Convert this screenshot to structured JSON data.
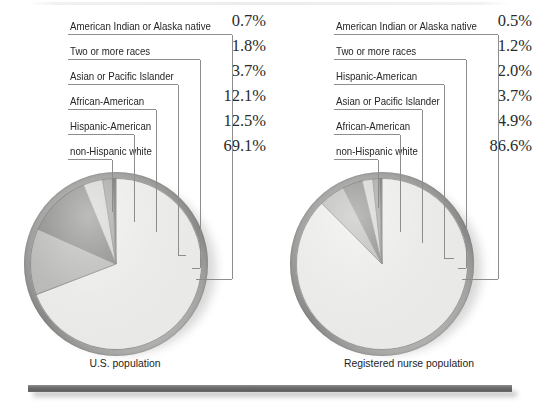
{
  "chart_data": [
    {
      "type": "pie",
      "title": "U.S. population",
      "caption": "U.S. population",
      "categories": [
        "non-Hispanic white",
        "Hispanic-American",
        "African-American",
        "Asian or Pacific Islander",
        "Two or more races",
        "American Indian or Alaska native"
      ],
      "values": [
        69.1,
        12.5,
        12.1,
        3.7,
        1.8,
        0.7
      ],
      "value_labels": [
        "69.1%",
        "12.5%",
        "12.1%",
        "3.7%",
        "1.8%",
        "0.7%"
      ],
      "unit": "percent",
      "legend_position": "above",
      "grid": false,
      "start_angle_deg": 0,
      "direction": "clockwise",
      "slice_colors": [
        "#e9e9e7",
        "#b4b4b2",
        "#7f7f7d",
        "#cfcfcd",
        "#9a9a98",
        "#5e5e5c"
      ]
    },
    {
      "type": "pie",
      "title": "Registered nurse population",
      "caption": "Registered nurse population",
      "categories": [
        "non-Hispanic white",
        "African-American",
        "Asian or Pacific Islander",
        "Hispanic-American",
        "Two or more races",
        "American Indian or Alaska native"
      ],
      "values": [
        86.6,
        4.9,
        3.7,
        2.0,
        1.2,
        0.5
      ],
      "value_labels": [
        "86.6%",
        "4.9%",
        "3.7%",
        "2.0%",
        "1.2%",
        "0.5%"
      ],
      "unit": "percent",
      "legend_position": "above",
      "grid": false,
      "start_angle_deg": 0,
      "direction": "clockwise",
      "slice_colors": [
        "#e9e9e7",
        "#b4b4b2",
        "#7f7f7d",
        "#cfcfcd",
        "#9a9a98",
        "#5e5e5c"
      ]
    }
  ],
  "left_chart": {
    "caption": "U.S. population",
    "legend": [
      {
        "pct": "0.7%",
        "label": "American Indian or Alaska native"
      },
      {
        "pct": "1.8%",
        "label": "Two or more races"
      },
      {
        "pct": "3.7%",
        "label": "Asian or Pacific Islander"
      },
      {
        "pct": "12.1%",
        "label": "African-American"
      },
      {
        "pct": "12.5%",
        "label": "Hispanic-American"
      },
      {
        "pct": "69.1%",
        "label": "non-Hispanic white"
      }
    ]
  },
  "right_chart": {
    "caption": "Registered nurse population",
    "legend": [
      {
        "pct": "0.5%",
        "label": "American Indian or Alaska native"
      },
      {
        "pct": "1.2%",
        "label": "Two or more races"
      },
      {
        "pct": "2.0%",
        "label": "Hispanic-American"
      },
      {
        "pct": "3.7%",
        "label": "Asian or Pacific Islander"
      },
      {
        "pct": "4.9%",
        "label": "African-American"
      },
      {
        "pct": "86.6%",
        "label": "non-Hispanic white"
      }
    ]
  },
  "style": {
    "slice_light": "#e9e9e7",
    "slice_mid_light": "#cfcfcd",
    "slice_mid": "#b4b4b2",
    "slice_mid_dark": "#9a9a98",
    "slice_dark": "#7f7f7d",
    "slice_darkest": "#5e5e5c",
    "leader_line": "#8d8d8d",
    "rule_color": "#6e6e6e",
    "text_color": "#262626"
  }
}
